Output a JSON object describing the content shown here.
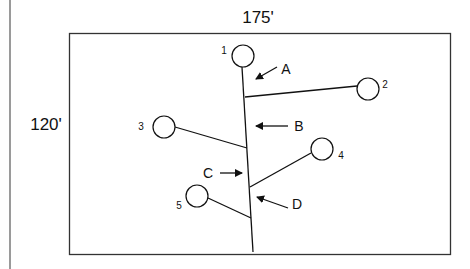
{
  "figure": {
    "width_label": "175'",
    "height_label": "120'",
    "colors": {
      "line": "#111111",
      "border": "#333333",
      "left_rule": "#9a9a9a",
      "background": "#ffffff"
    },
    "nodes": [
      {
        "id": "1",
        "label": "1"
      },
      {
        "id": "2",
        "label": "2"
      },
      {
        "id": "3",
        "label": "3"
      },
      {
        "id": "4",
        "label": "4"
      },
      {
        "id": "5",
        "label": "5"
      }
    ],
    "segments": [
      {
        "id": "A",
        "label": "A"
      },
      {
        "id": "B",
        "label": "B"
      },
      {
        "id": "C",
        "label": "C"
      },
      {
        "id": "D",
        "label": "D"
      }
    ]
  }
}
